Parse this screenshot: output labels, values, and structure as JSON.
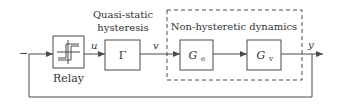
{
  "diagram": {
    "type": "block-diagram",
    "colors": {
      "line": "#4a4a4a",
      "text": "#333333",
      "background": "#ffffff"
    },
    "input_sign": "−",
    "blocks": {
      "relay": {
        "label": "Relay",
        "icon": "hysteresis-loop-icon"
      },
      "gamma": {
        "symbol": "Γ",
        "caption_line1": "Quasi-static",
        "caption_line2": "hysteresis"
      },
      "ge": {
        "symbol": "G",
        "subscript": "e"
      },
      "gv": {
        "symbol": "G",
        "subscript": "v"
      }
    },
    "group": {
      "label": "Non-hysteretic dynamics"
    },
    "signals": {
      "u": "u",
      "v": "v",
      "y": "y"
    }
  }
}
